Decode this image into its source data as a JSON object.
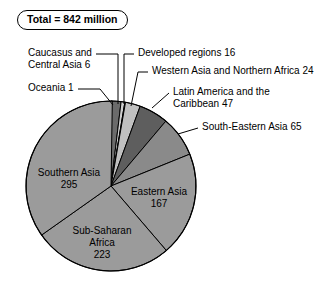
{
  "badge": {
    "text": "Total = 842 million"
  },
  "chart_data": {
    "type": "pie",
    "title": "Total = 842 million",
    "total": 842,
    "units": "million",
    "legend": "none",
    "grid": false,
    "categories": [
      "Developed regions",
      "Caucasus and Central Asia",
      "Oceania",
      "Western Asia and Northern Africa",
      "Latin America and the Caribbean",
      "South-Eastern Asia",
      "Eastern Asia",
      "Sub-Saharan Africa",
      "Southern Asia"
    ],
    "values": [
      16,
      6,
      1,
      24,
      47,
      65,
      167,
      223,
      295
    ],
    "slices": [
      {
        "name": "Developed regions",
        "value": 16,
        "label": "Developed regions 16",
        "color": "#6b6b6b",
        "start_deg": 0.0,
        "sweep_deg": 6.84
      },
      {
        "name": "Caucasus and Central Asia",
        "value": 6,
        "label": "Caucasus and Central Asia 6",
        "color": "#cfcfcf",
        "start_deg": 6.84,
        "sweep_deg": 2.57
      },
      {
        "name": "Oceania",
        "value": 1,
        "label": "Oceania 1",
        "color": "#4a4a4a",
        "start_deg": 9.41,
        "sweep_deg": 0.43
      },
      {
        "name": "Western Asia and Northern Africa",
        "value": 24,
        "label": "Western Asia and Northern Africa 24",
        "color": "#c0c0c0",
        "start_deg": 9.84,
        "sweep_deg": 10.26
      },
      {
        "name": "Latin America and the Caribbean",
        "value": 47,
        "label": "Latin America and the Caribbean 47",
        "color": "#5e5e5e",
        "start_deg": 20.1,
        "sweep_deg": 20.1
      },
      {
        "name": "South-Eastern Asia",
        "value": 65,
        "label": "South-Eastern Asia 65",
        "color": "#8a8a8a",
        "start_deg": 40.2,
        "sweep_deg": 27.79
      },
      {
        "name": "Eastern Asia",
        "value": 167,
        "label": "Eastern Asia 167",
        "color": "#9b9b9b",
        "start_deg": 67.99,
        "sweep_deg": 71.4
      },
      {
        "name": "Sub-Saharan Africa",
        "value": 223,
        "label": "Sub-Saharan Africa 223",
        "color": "#9b9b9b",
        "start_deg": 139.39,
        "sweep_deg": 95.36
      },
      {
        "name": "Southern Asia",
        "value": 295,
        "label": "Southern Asia 295",
        "color": "#9b9b9b",
        "start_deg": 234.75,
        "sweep_deg": 126.15
      }
    ]
  },
  "callouts": {
    "caucasus_line1": "Caucasus and",
    "caucasus_line2": "Central Asia 6",
    "oceania": "Oceania 1",
    "developed": "Developed regions 16",
    "western_asia": "Western Asia and Northern Africa 24",
    "latin_line1": "Latin America and the",
    "latin_line2": "Caribbean 47",
    "south_eastern": "South-Eastern Asia 65"
  },
  "inner_labels": {
    "southern_asia_name": "Southern Asia",
    "southern_asia_value": "295",
    "eastern_asia_name": "Eastern Asia",
    "eastern_asia_value": "167",
    "subsaharan_line1": "Sub-Saharan",
    "subsaharan_line2": "Africa",
    "subsaharan_value": "223"
  }
}
